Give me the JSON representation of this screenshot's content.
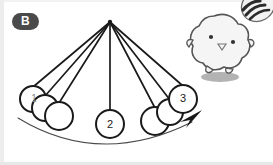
{
  "figure": {
    "panel_label": "B",
    "type": "pendulum-swing-diagram",
    "background_color": "#ffffff",
    "stroke_color": "#1a1a1a",
    "badge_color": "#4a4a4a",
    "badge_text_color": "#ffffff"
  },
  "pendulum": {
    "pivot": {
      "x": 110,
      "y": 22
    },
    "string_count": 7,
    "strings": [
      {
        "to_x": 33,
        "to_y": 86
      },
      {
        "to_x": 44,
        "to_y": 95
      },
      {
        "to_x": 57,
        "to_y": 102
      },
      {
        "to_x": 110,
        "to_y": 110
      },
      {
        "to_x": 156,
        "to_y": 107
      },
      {
        "to_x": 170,
        "to_y": 99
      },
      {
        "to_x": 182,
        "to_y": 88
      }
    ],
    "bobs": [
      {
        "label": "1",
        "x": 33,
        "y": 99,
        "r": 13,
        "faint": true
      },
      {
        "label": "",
        "x": 45,
        "y": 108,
        "r": 13,
        "faint": false
      },
      {
        "label": "",
        "x": 59,
        "y": 116,
        "r": 14,
        "faint": false
      },
      {
        "label": "2",
        "x": 110,
        "y": 124,
        "r": 14,
        "faint": false
      },
      {
        "label": "",
        "x": 155,
        "y": 121,
        "r": 14,
        "faint": false
      },
      {
        "label": "",
        "x": 170,
        "y": 112,
        "r": 13,
        "faint": false
      },
      {
        "label": "3",
        "x": 183,
        "y": 99,
        "r": 14,
        "faint": false
      }
    ]
  },
  "swing_arc": {
    "description": "curved motion arrow sweeping left to right",
    "color": "#3a3a3a",
    "arrowhead": {
      "x": 197,
      "y": 117,
      "angle_deg": -52
    }
  },
  "creature": {
    "name": "fluffy-cloud-creature",
    "x": 217,
    "y": 42,
    "body_color": "#f4f4f4",
    "outline_color": "#4d4d4d",
    "eye_color": "#3a3a3a",
    "shadow_color": "#9a9a9a",
    "shadow": {
      "x": 220,
      "y": 77,
      "rx": 19,
      "ry": 5
    }
  },
  "corner_object": {
    "name": "striped-bee-object",
    "x": 254,
    "y": 8,
    "stripe_color": "#2b2b2b",
    "body_color": "#f0f0f0"
  }
}
